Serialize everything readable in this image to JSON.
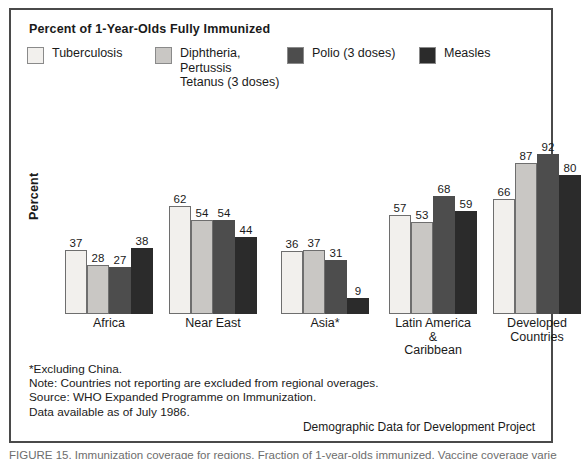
{
  "chart_data": {
    "type": "bar",
    "title": "Percent of 1-Year-Olds Fully Immunized",
    "xlabel": "",
    "ylabel": "Percent",
    "ylim": [
      0,
      100
    ],
    "grid": false,
    "legend_position": "top-left",
    "categories": [
      "Africa",
      "Near East",
      "Asia*",
      "Latin America\n&\nCaribbean",
      "Developed\nCountries"
    ],
    "series": [
      {
        "name": "Tuberculosis",
        "color": "#f2f0ed",
        "values": [
          37,
          62,
          36,
          57,
          66
        ]
      },
      {
        "name": "Diphtheria,\nPertussis\nTetanus (3 doses)",
        "color": "#c9c7c4",
        "values": [
          28,
          54,
          37,
          53,
          87
        ]
      },
      {
        "name": "Polio (3 doses)",
        "color": "#4d4d4d",
        "values": [
          27,
          54,
          31,
          68,
          92
        ]
      },
      {
        "name": "Measles",
        "color": "#2b2b2b",
        "values": [
          38,
          44,
          9,
          59,
          80
        ]
      }
    ],
    "annotations": [
      "*Excluding China.",
      "Note:  Countries not reporting are excluded from regional overages.",
      "Source:  WHO Expanded Programme on Immunization.",
      "Data available as of July 1986."
    ]
  },
  "credit": "Demographic Data for Development Project",
  "caption": "FIGURE 15.  Immunization coverage for regions. Fraction of 1-year-olds immunized. Vaccine coverage varies"
}
